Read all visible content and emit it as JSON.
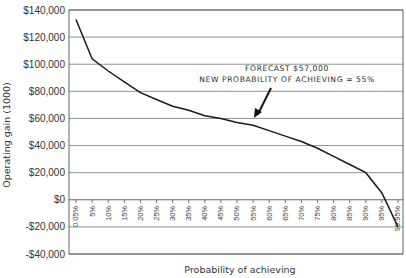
{
  "chart_data": {
    "type": "line",
    "title": "",
    "xlabel": "Probability of achieving",
    "ylabel": "Operating gain (1000)",
    "ylim": [
      -40000,
      140000
    ],
    "yticks": [
      140000,
      120000,
      100000,
      80000,
      60000,
      40000,
      20000,
      0,
      -20000,
      -40000
    ],
    "ytick_labels": [
      "$140,000",
      "$120,000",
      "$100,000",
      "$80,000",
      "$60,000",
      "$40,000",
      "$20,000",
      "$0",
      "-$20,000",
      "-$40,000"
    ],
    "categories": [
      "0.05%",
      "5%",
      "10%",
      "15%",
      "20%",
      "25%",
      "30%",
      "35%",
      "40%",
      "45%",
      "50%",
      "55%",
      "60%",
      "65%",
      "70%",
      "75%",
      "80%",
      "85%",
      "90%",
      "95%",
      "99.95%"
    ],
    "series": [
      {
        "name": "Operating gain",
        "values": [
          133000,
          104000,
          95000,
          87000,
          79000,
          74000,
          69000,
          66000,
          62000,
          60000,
          57000,
          55000,
          51000,
          47000,
          43000,
          38000,
          32000,
          26000,
          20000,
          5000,
          -20000
        ]
      }
    ],
    "grid": true,
    "legend": "none",
    "annotations": [
      {
        "text_line1": "FORECAST $57,000",
        "text_line2": "NEW PROBABILITY OF ACHIEVING = 55%",
        "arrow_target_x": "55%",
        "arrow_target_y": 57000
      }
    ]
  },
  "labels": {
    "annotation_line1": "FORECAST $57,000",
    "annotation_line2": "NEW PROBABILITY OF ACHIEVING = 55%",
    "xlabel": "Probability of achieving",
    "ylabel": "Operating gain (1000)"
  }
}
